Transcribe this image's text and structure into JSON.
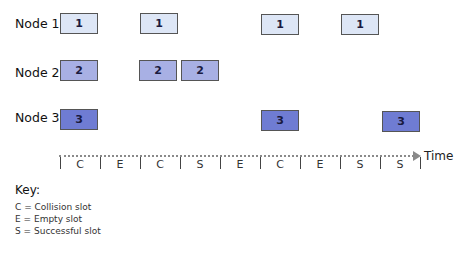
{
  "nodes": [
    {
      "label": "Node 1",
      "box_text": "1",
      "color": "#dde6f6",
      "slots": [
        0,
        2,
        5,
        7
      ]
    },
    {
      "label": "Node 2",
      "box_text": "2",
      "color": "#a8b0e4",
      "slots": [
        0,
        2,
        3
      ]
    },
    {
      "label": "Node 3",
      "box_text": "3",
      "color": "#6f7cd3",
      "slots": [
        0,
        5,
        8
      ]
    }
  ],
  "timeline": {
    "axis_label": "Time",
    "slots": [
      "C",
      "E",
      "C",
      "S",
      "E",
      "C",
      "E",
      "S",
      "S"
    ]
  },
  "key": {
    "title": "Key:",
    "items": [
      "C = Collision slot",
      "E = Empty slot",
      "S = Successful slot"
    ]
  }
}
